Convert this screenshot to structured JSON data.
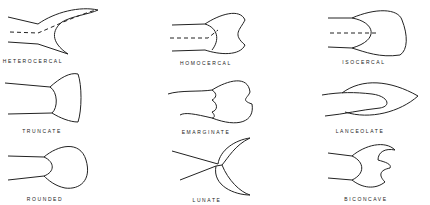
{
  "fins": [
    {
      "id": "heterocercal",
      "label": "HETEROCERCAL"
    },
    {
      "id": "homocercal",
      "label": "HOMOCERCAL"
    },
    {
      "id": "isocercal",
      "label": "ISOCERCAL"
    },
    {
      "id": "truncate",
      "label": "TRUNCATE"
    },
    {
      "id": "emarginate",
      "label": "EMARGINATE"
    },
    {
      "id": "lanceolate",
      "label": "LANCEOLATE"
    },
    {
      "id": "rounded",
      "label": "ROUNDED"
    },
    {
      "id": "lunate",
      "label": "LUNATE"
    },
    {
      "id": "biconcave",
      "label": "BICONCAVE"
    }
  ]
}
